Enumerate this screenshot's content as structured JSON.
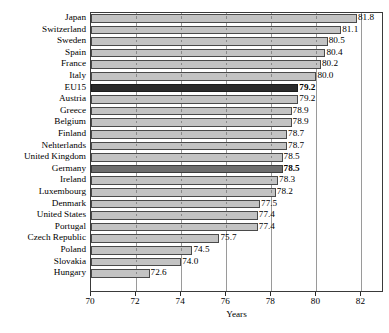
{
  "chart_data": {
    "type": "bar",
    "orientation": "horizontal",
    "title": "",
    "xlabel": "Years",
    "ylabel": "",
    "xlim": [
      70,
      83
    ],
    "xticks": [
      70,
      72,
      74,
      76,
      78,
      80,
      82
    ],
    "grid": true,
    "legend": "none",
    "categories": [
      "Japan",
      "Switzerland",
      "Sweden",
      "Spain",
      "France",
      "Italy",
      "EU15",
      "Austria",
      "Greece",
      "Belgium",
      "Finland",
      "Nehterlands",
      "United Kingdom",
      "Germany",
      "Ireland",
      "Luxembourg",
      "Denmark",
      "United States",
      "Portugal",
      "Czech Republic",
      "Poland",
      "Slovakia",
      "Hungary"
    ],
    "values": [
      81.8,
      81.1,
      80.5,
      80.4,
      80.2,
      80.0,
      79.2,
      79.2,
      78.9,
      78.9,
      78.7,
      78.7,
      78.5,
      78.5,
      78.3,
      78.2,
      77.5,
      77.4,
      77.4,
      75.7,
      74.5,
      74.0,
      72.6
    ],
    "value_labels": [
      "81.8",
      "81.1",
      "80.5",
      "80.4",
      "80.2",
      "80.0",
      "79.2",
      "79.2",
      "78.9",
      "78.9",
      "78.7",
      "78.7",
      "78.5",
      "78.5",
      "78.3",
      "78.2",
      "77.5",
      "77.4",
      "77.4",
      "75.7",
      "74.5",
      "74.0",
      "72.6"
    ],
    "emphasis": {
      "EU15": "dark",
      "Germany": "mid"
    },
    "bold_labels": [
      "EU15",
      "Germany"
    ],
    "colors": {
      "bar_fill": "#c3c3c3",
      "bar_outline": "#4a4a4a",
      "highlight_dark_fill": "#2b2b2b",
      "highlight_mid_fill": "#6e6e6e",
      "gridline": "#9a9a9a",
      "axis": "#3a3a3a",
      "text": "#000000",
      "background": "#ffffff"
    }
  }
}
